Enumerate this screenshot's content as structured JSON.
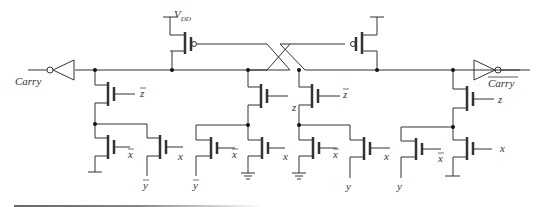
{
  "diagram": {
    "type": "CMOS dynamic carry circuit schematic",
    "labels": {
      "vdd": "V",
      "vdd_sub": "DD",
      "carry_in": "Carry",
      "carry_out": "Carry",
      "carry_out_overbar": true
    },
    "gate_labels": {
      "g1": "z",
      "g1_bar": true,
      "g2": "z",
      "g2_bar": false,
      "g3": "z",
      "g3_bar": true,
      "g4": "z",
      "g4_bar": false,
      "l1a": "x",
      "l1a_bar": true,
      "l1b": "x",
      "l1b_bar": false,
      "l2a": "x",
      "l2a_bar": true,
      "l2b": "x",
      "l2b_bar": false,
      "l3a": "x",
      "l3a_bar": true,
      "l3b": "x",
      "l3b_bar": false,
      "l4a": "x",
      "l4a_bar": true,
      "l4b": "x",
      "l4b_bar": false
    },
    "source_labels": {
      "s1": "y",
      "s1_bar": true,
      "s2": "y",
      "s2_bar": true,
      "s3": "y",
      "s3_bar": false,
      "s4": "y",
      "s4_bar": false
    },
    "colors": {
      "wire": "#333333",
      "node": "#111111"
    }
  }
}
